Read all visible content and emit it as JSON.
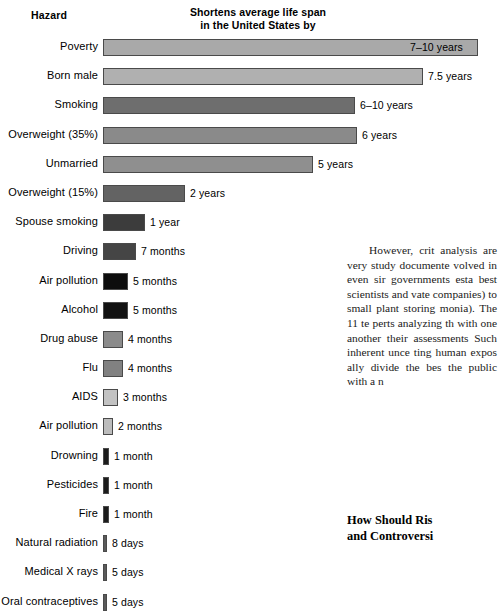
{
  "figure": {
    "header_hazard": "Hazard",
    "header_main_line1": "Shortens average life span",
    "header_main_line2": "in the United States by"
  },
  "chart_data": {
    "type": "bar",
    "title": "Shortens average life span in the United States by",
    "xlabel": "",
    "ylabel": "Hazard",
    "orientation": "horizontal",
    "grid": false,
    "legend": null,
    "categories": [
      "Poverty",
      "Born male",
      "Smoking",
      "Overweight (35%)",
      "Unmarried",
      "Overweight (15%)",
      "Spouse smoking",
      "Driving",
      "Air pollution",
      "Alcohol",
      "Drug abuse",
      "Flu",
      "AIDS",
      "Air pollution",
      "Drowning",
      "Pesticides",
      "Fire",
      "Natural radiation",
      "Medical X rays",
      "Oral contraceptives"
    ],
    "value_labels": [
      "7–10 years",
      "7.5 years",
      "6–10 years",
      "6 years",
      "5 years",
      "2 years",
      "1 year",
      "7 months",
      "5 months",
      "5 months",
      "4 months",
      "4 months",
      "3 months",
      "2 months",
      "1 month",
      "1 month",
      "1 month",
      "8 days",
      "5 days",
      "5 days"
    ],
    "values_years": [
      8.5,
      7.5,
      8.0,
      6.0,
      5.0,
      2.0,
      1.0,
      0.583,
      0.417,
      0.417,
      0.333,
      0.333,
      0.25,
      0.167,
      0.083,
      0.083,
      0.083,
      0.022,
      0.014,
      0.014
    ],
    "bar_px_width": [
      375,
      320,
      252,
      254,
      210,
      82,
      42,
      33,
      25,
      25,
      20,
      20,
      15,
      10,
      6,
      6,
      6,
      4,
      4,
      4
    ],
    "bar_colors": [
      "#a9a9a9",
      "#b0b0b0",
      "#6e6e6e",
      "#8a8a8a",
      "#8f8f8f",
      "#636363",
      "#3c3c3c",
      "#454545",
      "#0d0d0d",
      "#121212",
      "#8b8b8b",
      "#818181",
      "#c2c2c2",
      "#bcbcbc",
      "#1c1c1c",
      "#1c1c1c",
      "#1c1c1c",
      "#5a5a5a",
      "#5a5a5a",
      "#5a5a5a"
    ],
    "label_inside_bar": [
      true,
      false,
      false,
      false,
      false,
      false,
      false,
      false,
      false,
      false,
      false,
      false,
      false,
      false,
      false,
      false,
      false,
      false,
      false,
      false
    ]
  },
  "bodytext": {
    "paragraph": "However, crit analysis are very study documente volved in even sir governments esta best scientists and vate companies) to small plant storing monia). The 11 te perts analyzing th with one another their assessments Such inherent unce ting human expos ally divide the bes the public with a n"
  },
  "section_heading": {
    "line1": "How Should Ris",
    "line2": "and Controversi"
  }
}
